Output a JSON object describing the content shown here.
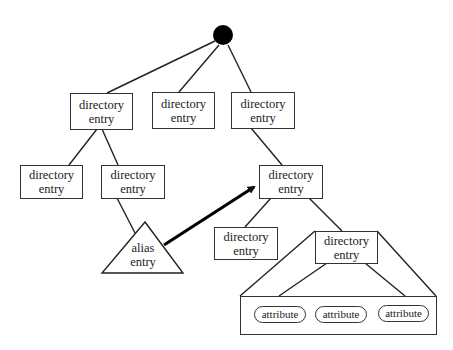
{
  "diagram": {
    "root": {
      "shape": "filled-circle",
      "color": "#000000"
    },
    "nodes": {
      "a": {
        "line1": "directory",
        "line2": "entry"
      },
      "b": {
        "line1": "directory",
        "line2": "entry"
      },
      "c": {
        "line1": "directory",
        "line2": "entry"
      },
      "d": {
        "line1": "directory",
        "line2": "entry"
      },
      "e": {
        "line1": "directory",
        "line2": "entry"
      },
      "f": {
        "line1": "directory",
        "line2": "entry"
      },
      "g": {
        "line1": "directory",
        "line2": "entry"
      },
      "h": {
        "line1": "directory",
        "line2": "entry"
      }
    },
    "alias": {
      "line1": "alias",
      "line2": "entry",
      "shape": "triangle"
    },
    "attributes": [
      "attribute",
      "attribute",
      "attribute"
    ],
    "edges": [
      [
        "root",
        "a"
      ],
      [
        "root",
        "b"
      ],
      [
        "root",
        "c"
      ],
      [
        "a",
        "d"
      ],
      [
        "a",
        "e"
      ],
      [
        "c",
        "f"
      ],
      [
        "e",
        "alias"
      ],
      [
        "f",
        "g"
      ],
      [
        "f",
        "h"
      ],
      [
        "h",
        "attributes"
      ]
    ],
    "alias_pointer": {
      "from": "alias",
      "to": "f",
      "style": "thick-arrow"
    }
  }
}
